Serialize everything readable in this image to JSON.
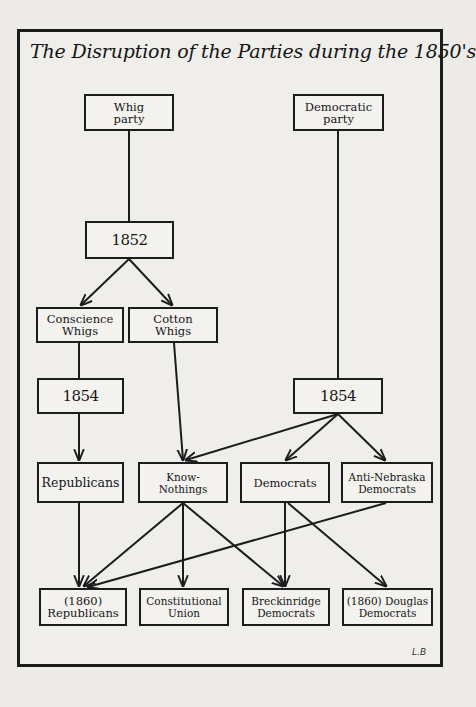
{
  "diagram": {
    "title": "The Disruption of the Parties during the 1850's",
    "signature": "L.B",
    "nodes": {
      "whig_party": "Whig\nparty",
      "democratic_party": "Democratic\nparty",
      "whig_1852": "1852",
      "conscience_whigs": "Conscience\nWhigs",
      "cotton_whigs": "Cotton\nWhigs",
      "whig_1854": "1854",
      "dem_1854": "1854",
      "republicans": "Republicans",
      "know_nothings": "Know-Nothings",
      "democrats": "Democrats",
      "anti_nebraska_democrats": "Anti-Nebraska\nDemocrats",
      "republicans_1860": "(1860)\nRepublicans",
      "constitutional_union": "Constitutional\nUnion",
      "breckinridge_democrats": "Breckinridge\nDemocrats",
      "douglas_democrats_1860": "(1860) Douglas\nDemocrats"
    },
    "edges": [
      {
        "from": "Whig party",
        "to": "1852",
        "arrow": false
      },
      {
        "from": "1852",
        "to": "Conscience Whigs",
        "arrow": true
      },
      {
        "from": "1852",
        "to": "Cotton Whigs",
        "arrow": true
      },
      {
        "from": "Conscience Whigs",
        "to": "1854",
        "arrow": false
      },
      {
        "from": "1854",
        "to": "Republicans",
        "arrow": true
      },
      {
        "from": "Cotton Whigs",
        "to": "Know-Nothings",
        "arrow": true
      },
      {
        "from": "Democratic party",
        "to": "1854",
        "arrow": false
      },
      {
        "from": "1854 (Democratic)",
        "to": "Know-Nothings",
        "arrow": true
      },
      {
        "from": "1854 (Democratic)",
        "to": "Democrats",
        "arrow": true
      },
      {
        "from": "1854 (Democratic)",
        "to": "Anti-Nebraska Democrats",
        "arrow": true
      },
      {
        "from": "Republicans",
        "to": "(1860) Republicans",
        "arrow": true
      },
      {
        "from": "Know-Nothings",
        "to": "(1860) Republicans",
        "arrow": true
      },
      {
        "from": "Know-Nothings",
        "to": "Constitutional Union",
        "arrow": true
      },
      {
        "from": "Know-Nothings",
        "to": "Breckinridge Democrats",
        "arrow": true
      },
      {
        "from": "Anti-Nebraska Democrats",
        "to": "(1860) Republicans",
        "arrow": true
      },
      {
        "from": "Democrats",
        "to": "Breckinridge Democrats",
        "arrow": true
      },
      {
        "from": "Democrats",
        "to": "(1860) Douglas Democrats",
        "arrow": true
      }
    ]
  }
}
